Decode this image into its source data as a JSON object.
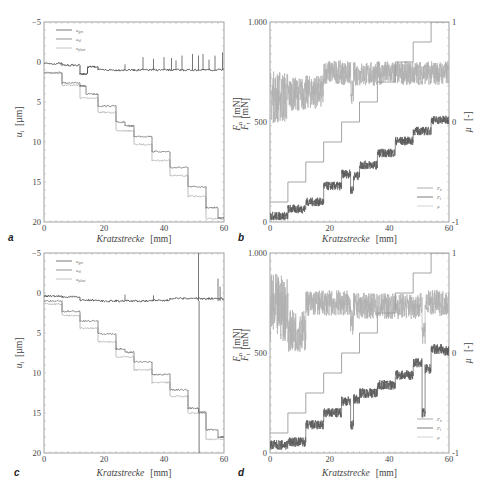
{
  "figure": {
    "panels": [
      "a",
      "b",
      "c",
      "d"
    ]
  },
  "chart_data": [
    {
      "id": "a",
      "type": "line",
      "panel_label": "a",
      "xlabel": "Kratzstrecke",
      "xunit": "[mm]",
      "ylabel": "u",
      "ylabel_sub": "i",
      "yunit": "[µm]",
      "xlim": [
        0,
        60
      ],
      "ylim": [
        -5,
        20
      ],
      "y_inverted": true,
      "xticks": [
        0,
        20,
        40,
        60
      ],
      "yticks": [
        -5,
        0,
        5,
        10,
        15,
        20
      ],
      "ytick_labels": [
        "−5",
        "0",
        "5",
        "10",
        "15",
        "20"
      ],
      "legend": [
        "u_ges",
        "u_el",
        "u_plast"
      ],
      "legend_position": "upper left",
      "series": [
        {
          "name": "u_ges",
          "color": "#555555",
          "steps": [
            [
              0,
              6,
              0.2
            ],
            [
              6,
              12,
              0.4
            ],
            [
              12,
              14.5,
              1.5
            ],
            [
              14.5,
              18,
              0.6
            ],
            [
              18,
              24,
              1.0
            ],
            [
              24,
              30,
              1.0
            ],
            [
              30,
              36,
              1.0
            ],
            [
              36,
              42,
              1.0
            ],
            [
              42,
              48,
              1.0
            ],
            [
              48,
              54,
              1.0
            ],
            [
              54,
              60,
              1.0
            ]
          ],
          "spikes": [
            [
              27,
              0.3
            ],
            [
              33,
              -0.6
            ],
            [
              36.5,
              -0.4
            ],
            [
              40,
              -0.6
            ],
            [
              42.5,
              -0.5
            ],
            [
              44,
              -0.2
            ],
            [
              46,
              -0.8
            ],
            [
              49.5,
              -1.0
            ],
            [
              51.5,
              -0.8
            ],
            [
              53,
              -1.0
            ],
            [
              55,
              -0.3
            ],
            [
              57,
              -0.8
            ],
            [
              59.5,
              -1.2
            ]
          ]
        },
        {
          "name": "u_el",
          "color": "#7a7a7a",
          "steps": [
            [
              0,
              6,
              1.3
            ],
            [
              6,
              12,
              2.6
            ],
            [
              12,
              14,
              3.0
            ],
            [
              14,
              18,
              4.0
            ],
            [
              18,
              24,
              5.5
            ],
            [
              24,
              27,
              7.5
            ],
            [
              27,
              30,
              8.0
            ],
            [
              30,
              36,
              9.3
            ],
            [
              36,
              42,
              11.2
            ],
            [
              42,
              48,
              13.2
            ],
            [
              48,
              54,
              15.6
            ],
            [
              54,
              58,
              18.2
            ],
            [
              58,
              60,
              19.5
            ]
          ]
        },
        {
          "name": "u_plast",
          "color": "#b5b5b5",
          "steps": [
            [
              0,
              6,
              1.4
            ],
            [
              6,
              12,
              2.9
            ],
            [
              12,
              18,
              4.5
            ],
            [
              18,
              24,
              6.3
            ],
            [
              24,
              30,
              8.6
            ],
            [
              30,
              36,
              10.3
            ],
            [
              36,
              42,
              12.3
            ],
            [
              42,
              48,
              14.2
            ],
            [
              48,
              54,
              16.8
            ],
            [
              54,
              60,
              19.6
            ]
          ]
        }
      ]
    },
    {
      "id": "b",
      "type": "line",
      "panel_label": "b",
      "xlabel": "Kratzstrecke",
      "xunit": "[mm]",
      "ylabel_left": [
        "F_n [mN]",
        "F_t [mN]"
      ],
      "ylabel_right": "µ",
      "yunit_right": "[-]",
      "xlim": [
        0,
        60
      ],
      "ylim_left": [
        0,
        1000
      ],
      "ylim_right": [
        -1,
        1
      ],
      "xticks": [
        0,
        20,
        40,
        60
      ],
      "yticks_left": [
        0,
        500,
        1000
      ],
      "ytick_labels_left": [
        "0",
        "500",
        "1.000"
      ],
      "yticks_right": [
        -1,
        0,
        1
      ],
      "ytick_labels_right": [
        "-1",
        "0",
        "1"
      ],
      "legend": [
        "F_n",
        "F_t",
        "µ"
      ],
      "legend_position": "lower right",
      "series": [
        {
          "name": "F_n",
          "axis": "left",
          "color": "#9a9a9a",
          "noise": 0,
          "steps": [
            [
              0,
              6,
              100
            ],
            [
              6,
              12,
              200
            ],
            [
              12,
              18,
              300
            ],
            [
              18,
              24,
              400
            ],
            [
              24,
              30,
              500
            ],
            [
              30,
              36,
              600
            ],
            [
              36,
              42,
              700
            ],
            [
              42,
              48,
              800
            ],
            [
              48,
              54,
              900
            ],
            [
              54,
              60,
              1000
            ]
          ]
        },
        {
          "name": "F_t",
          "axis": "left",
          "color": "#5a5a5a",
          "noise": 22,
          "steps": [
            [
              0,
              6,
              30
            ],
            [
              6,
              12,
              65
            ],
            [
              12,
              18,
              100
            ],
            [
              18,
              24,
              180
            ],
            [
              24,
              27,
              240
            ],
            [
              27,
              28,
              160
            ],
            [
              28,
              30,
              230
            ],
            [
              30,
              36,
              285
            ],
            [
              36,
              42,
              345
            ],
            [
              42,
              48,
              405
            ],
            [
              48,
              54,
              455
            ],
            [
              54,
              60,
              510
            ]
          ]
        },
        {
          "name": "µ",
          "axis": "right",
          "color": "#b0b0b0",
          "noise": 0.12,
          "steps": [
            [
              0,
              6,
              0.25
            ],
            [
              6,
              12,
              0.28
            ],
            [
              12,
              18,
              0.3
            ],
            [
              18,
              24,
              0.5
            ],
            [
              24,
              27,
              0.49
            ],
            [
              27,
              28,
              0.3
            ],
            [
              28,
              36,
              0.48
            ],
            [
              36,
              60,
              0.49
            ]
          ]
        }
      ]
    },
    {
      "id": "c",
      "type": "line",
      "panel_label": "c",
      "xlabel": "Kratzstrecke",
      "xunit": "[mm]",
      "ylabel": "u",
      "ylabel_sub": "i",
      "yunit": "[µm]",
      "xlim": [
        0,
        60
      ],
      "ylim": [
        -5,
        20
      ],
      "y_inverted": true,
      "xticks": [
        0,
        20,
        40,
        60
      ],
      "yticks": [
        -5,
        0,
        5,
        10,
        15,
        20
      ],
      "ytick_labels": [
        "−5",
        "0",
        "5",
        "10",
        "15",
        "20"
      ],
      "legend": [
        "u_ges",
        "u_el",
        "u_plast"
      ],
      "legend_position": "upper left",
      "series": [
        {
          "name": "u_ges",
          "color": "#555555",
          "steps": [
            [
              0,
              6,
              0.4
            ],
            [
              6,
              12,
              0.5
            ],
            [
              12,
              18,
              0.9
            ],
            [
              18,
              24,
              1.0
            ],
            [
              24,
              30,
              1.0
            ],
            [
              30,
              36,
              1.0
            ],
            [
              36,
              42,
              0.9
            ],
            [
              42,
              48,
              0.7
            ],
            [
              48,
              54,
              0.7
            ],
            [
              54,
              60,
              0.7
            ]
          ],
          "spikes": [
            [
              27,
              0.2
            ],
            [
              36.5,
              0.3
            ],
            [
              51.5,
              -5
            ],
            [
              51.7,
              20
            ],
            [
              58,
              -1.8
            ],
            [
              58.7,
              -0.8
            ]
          ]
        },
        {
          "name": "u_el",
          "color": "#7a7a7a",
          "steps": [
            [
              0,
              6,
              1.0
            ],
            [
              6,
              12,
              2.3
            ],
            [
              12,
              18,
              3.5
            ],
            [
              18,
              24,
              5.1
            ],
            [
              24,
              27,
              7.0
            ],
            [
              27,
              30,
              7.4
            ],
            [
              30,
              36,
              8.6
            ],
            [
              36,
              42,
              10.2
            ],
            [
              42,
              48,
              12.1
            ],
            [
              48,
              51.5,
              14.4
            ],
            [
              51.5,
              54,
              14.9
            ],
            [
              54,
              58,
              17.1
            ],
            [
              58,
              60,
              18.0
            ]
          ]
        },
        {
          "name": "u_plast",
          "color": "#b5b5b5",
          "steps": [
            [
              0,
              6,
              1.4
            ],
            [
              6,
              12,
              2.8
            ],
            [
              12,
              18,
              4.4
            ],
            [
              18,
              24,
              6.1
            ],
            [
              24,
              30,
              8.0
            ],
            [
              30,
              36,
              9.6
            ],
            [
              36,
              42,
              11.2
            ],
            [
              42,
              48,
              12.9
            ],
            [
              48,
              54,
              15.0
            ],
            [
              54,
              60,
              18.3
            ]
          ]
        }
      ]
    },
    {
      "id": "d",
      "type": "line",
      "panel_label": "d",
      "xlabel": "Kratzstrecke",
      "xunit": "[mm]",
      "ylabel_left": [
        "F_n [mN]",
        "F_t [mN]"
      ],
      "ylabel_right": "µ",
      "yunit_right": "[-]",
      "xlim": [
        0,
        60
      ],
      "ylim_left": [
        0,
        1000
      ],
      "ylim_right": [
        -1,
        1
      ],
      "xticks": [
        0,
        20,
        40,
        60
      ],
      "yticks_left": [
        0,
        500,
        1000
      ],
      "ytick_labels_left": [
        "0",
        "500",
        "1.000"
      ],
      "yticks_right": [
        -1,
        0,
        1
      ],
      "ytick_labels_right": [
        "-1",
        "0",
        "1"
      ],
      "legend": [
        "F_n",
        "F_t",
        "µ"
      ],
      "legend_position": "lower right",
      "series": [
        {
          "name": "F_n",
          "axis": "left",
          "color": "#9a9a9a",
          "noise": 0,
          "steps": [
            [
              0,
              6,
              100
            ],
            [
              6,
              12,
              200
            ],
            [
              12,
              18,
              300
            ],
            [
              18,
              24,
              400
            ],
            [
              24,
              30,
              500
            ],
            [
              30,
              36,
              600
            ],
            [
              36,
              42,
              700
            ],
            [
              42,
              48,
              800
            ],
            [
              48,
              54,
              900
            ],
            [
              54,
              60,
              1000
            ]
          ]
        },
        {
          "name": "F_t",
          "axis": "left",
          "color": "#5a5a5a",
          "noise": 25,
          "steps": [
            [
              0,
              6,
              40
            ],
            [
              6,
              12,
              55
            ],
            [
              12,
              18,
              140
            ],
            [
              18,
              24,
              200
            ],
            [
              24,
              27,
              260
            ],
            [
              27,
              28,
              140
            ],
            [
              28,
              30,
              270
            ],
            [
              30,
              36,
              300
            ],
            [
              36,
              42,
              340
            ],
            [
              42,
              48,
              390
            ],
            [
              48,
              51,
              450
            ],
            [
              51,
              52,
              200
            ],
            [
              52,
              54,
              420
            ],
            [
              54,
              58,
              520
            ],
            [
              58,
              60,
              510
            ]
          ]
        },
        {
          "name": "µ",
          "axis": "right",
          "color": "#b0b0b0",
          "noise": 0.13,
          "steps": [
            [
              0,
              6,
              0.45
            ],
            [
              6,
              12,
              0.22
            ],
            [
              12,
              27,
              0.5
            ],
            [
              27,
              28,
              0.3
            ],
            [
              28,
              51,
              0.47
            ],
            [
              51,
              52,
              0.22
            ],
            [
              52,
              60,
              0.5
            ]
          ]
        }
      ]
    }
  ]
}
